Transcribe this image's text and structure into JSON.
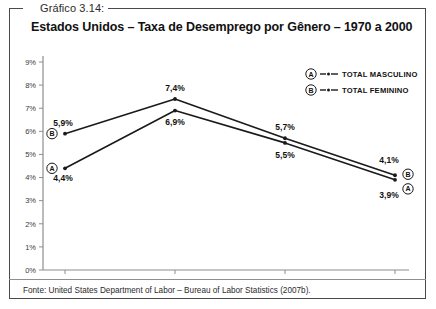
{
  "caption": {
    "label": "Gráfico 3.14:",
    "title": "Estados Unidos – Taxa de Desemprego por Gênero – 1970 a 2000"
  },
  "source": {
    "note": "Fonte: United States Department of Labor – Bureau of Labor Statistics (2007b)."
  },
  "legend": {
    "items": [
      {
        "key": "A",
        "label": "TOTAL MASCULINO"
      },
      {
        "key": "B",
        "label": "TOTAL FEMININO"
      }
    ]
  },
  "colors": {
    "line": "#1a1a1a",
    "axis": "#8e8e8e",
    "frame": "#4a4a4a",
    "text": "#111111"
  },
  "chart_data": {
    "type": "line",
    "title": "Estados Unidos – Taxa de Desemprego por Gênero – 1970 a 2000",
    "xlabel": "",
    "ylabel": "",
    "categories": [
      "1970",
      "1980",
      "1990",
      "2000"
    ],
    "x": [
      1970,
      1980,
      1990,
      2000
    ],
    "ylim": [
      0,
      9
    ],
    "ytick_labels": [
      "0%",
      "1%",
      "2%",
      "3%",
      "4%",
      "5%",
      "6%",
      "7%",
      "8%",
      "9%"
    ],
    "ytick_values": [
      0,
      1,
      2,
      3,
      4,
      5,
      6,
      7,
      8,
      9
    ],
    "grid": false,
    "legend_position": "top-right",
    "series": [
      {
        "name": "TOTAL MASCULINO",
        "key": "A",
        "values": [
          4.4,
          6.9,
          5.5,
          3.9
        ],
        "point_labels": [
          "4,4%",
          "6,9%",
          "5,5%",
          "3,9%"
        ]
      },
      {
        "name": "TOTAL FEMININO",
        "key": "B",
        "values": [
          5.9,
          7.4,
          5.7,
          4.1
        ],
        "point_labels": [
          "5,9%",
          "7,4%",
          "5,7%",
          "4,1%"
        ]
      }
    ]
  }
}
